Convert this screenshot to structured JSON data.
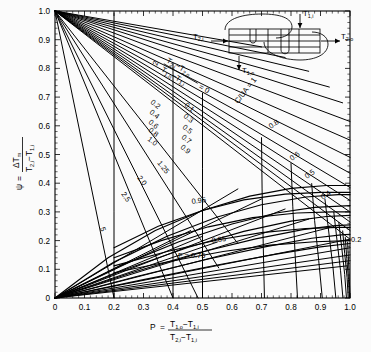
{
  "chart_data": {
    "type": "line",
    "title": "",
    "xlabel": "P = (T1,o - T1,i) / (T2,i - T1,i)",
    "ylabel": "psi = dTm / (T2,i - T1,i)",
    "xlim": [
      0,
      1
    ],
    "ylim": [
      0,
      1
    ],
    "grid": false,
    "xticks": [
      "0",
      "0.1",
      "0.2",
      "0.3",
      "0.4",
      "0.5",
      "0.6",
      "0.7",
      "0.8",
      "0.9",
      "1.0"
    ],
    "yticks": [
      "0",
      "0.1",
      "0.2",
      "0.3",
      "0.4",
      "0.5",
      "0.6",
      "0.7",
      "0.8",
      "0.9",
      "1.0"
    ],
    "xtick_values": [
      0,
      0.1,
      0.2,
      0.3,
      0.4,
      0.5,
      0.6,
      0.7,
      0.8,
      0.9,
      1.0
    ],
    "ytick_values": [
      0,
      0.1,
      0.2,
      0.3,
      0.4,
      0.5,
      0.6,
      0.7,
      0.8,
      0.9,
      1.0
    ],
    "minor_ticks_per_interval": 5,
    "r_parameter_name": "R = (T2,i - T2,o) / (T1,o - T1,i)",
    "r_labels": [
      "0",
      "0.1",
      "0.2",
      "0.3",
      "0.4",
      "0.5",
      "0.6",
      "0.7",
      "0.8",
      "0.9",
      "1.0",
      "1.25",
      "2.0",
      "2.5",
      "5"
    ],
    "f_contour_labels": [
      "0.2",
      "0.4",
      "0.5",
      "0.6",
      "0.8",
      "0.85",
      "0.95"
    ],
    "f_label_prefix": "F = 0.75",
    "cua_label": "C/UA = 1",
    "note": "LMTD correction / psi chart for a 1 shell-pass, 2 tube-pass shell-and-tube heat exchanger"
  },
  "axes": {
    "y_label_psi": "ψ",
    "y_label_eq": "=",
    "y_label_num": "ΔT",
    "y_label_num_sub": "m",
    "y_label_den_a": "T",
    "y_label_den_a_sub": "2,i",
    "y_label_den_minus": "−",
    "y_label_den_b": "T",
    "y_label_den_b_sub": "1,i",
    "x_label_p": "P",
    "x_label_eq": "=",
    "x_label_num_a": "T",
    "x_label_num_a_sub": "1,o",
    "x_label_num_minus": "−",
    "x_label_num_b": "T",
    "x_label_num_b_sub": "1,i",
    "x_label_den_a": "T",
    "x_label_den_a_sub": "2,i",
    "x_label_den_minus": "−",
    "x_label_den_b": "T",
    "x_label_den_b_sub": "1,i"
  },
  "r_annotation": {
    "num_a": "T",
    "num_a_sub": "2,i",
    "num_minus": "−",
    "num_b": "T",
    "num_b_sub": "2,o",
    "den_a": "T",
    "den_a_sub": "1,o",
    "den_minus": "−",
    "den_b": "T",
    "den_b_sub": "1,i",
    "equals_zero": "= 0",
    "cua": "C/UA = 1"
  },
  "inset": {
    "name": "shell-and-tube-heat-exchanger",
    "t2i": "T",
    "t2i_sub": "2,i",
    "t2o": "T",
    "t2o_sub": "2,o",
    "t1i": "T",
    "t1i_sub": "1,i",
    "t1o": "T",
    "t1o_sub": "1,o"
  },
  "ticklabels_x": [
    "0",
    "0.1",
    "0.2",
    "0.3",
    "0.4",
    "0.5",
    "0.6",
    "0.7",
    "0.8",
    "0.9",
    "1.0"
  ],
  "ticklabels_y": [
    "0",
    "0.1",
    "0.2",
    "0.3",
    "0.4",
    "0.5",
    "0.6",
    "0.7",
    "0.8",
    "0.9",
    "1.0"
  ],
  "r_curve_labels": [
    {
      "text": "2",
      "id": "r-top-2"
    },
    {
      "text": "0.2",
      "id": "r-02"
    },
    {
      "text": "0.4",
      "id": "r-04"
    },
    {
      "text": "0.6",
      "id": "r-06"
    },
    {
      "text": "0.8",
      "id": "r-08"
    },
    {
      "text": "1.0",
      "id": "r-10"
    },
    {
      "text": "0.1",
      "id": "r-01"
    },
    {
      "text": "0.3",
      "id": "r-03"
    },
    {
      "text": "0.5",
      "id": "r-05"
    },
    {
      "text": "0.7",
      "id": "r-07"
    },
    {
      "text": "0.9",
      "id": "r-09"
    },
    {
      "text": "1.25",
      "id": "r-125"
    },
    {
      "text": "2.0",
      "id": "r-20"
    },
    {
      "text": "2.5",
      "id": "r-25"
    },
    {
      "text": "5",
      "id": "r-5"
    }
  ],
  "f_curve_labels": [
    {
      "text": "0.8",
      "id": "f-08"
    },
    {
      "text": "0.6",
      "id": "f-06"
    },
    {
      "text": "0.5",
      "id": "f-05"
    },
    {
      "text": "0.4",
      "id": "f-04"
    },
    {
      "text": "0.2",
      "id": "f-02"
    },
    {
      "text": "0.95",
      "id": "f-095"
    },
    {
      "text": "0.85",
      "id": "f-085"
    },
    {
      "text": "F = 0.75",
      "id": "f-075"
    }
  ]
}
